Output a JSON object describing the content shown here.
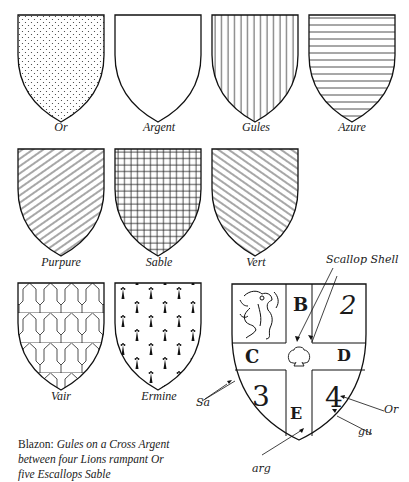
{
  "tinctures": [
    {
      "name": "Or",
      "pattern": "dots"
    },
    {
      "name": "Argent",
      "pattern": "plain"
    },
    {
      "name": "Gules",
      "pattern": "vertical-lines"
    },
    {
      "name": "Azure",
      "pattern": "horizontal-lines"
    },
    {
      "name": "Purpure",
      "pattern": "diagonal-sinister"
    },
    {
      "name": "Sable",
      "pattern": "grid"
    },
    {
      "name": "Vert",
      "pattern": "diagonal-dexter"
    },
    {
      "name": "Vair",
      "pattern": "vair"
    },
    {
      "name": "Ermine",
      "pattern": "ermine-spots"
    }
  ],
  "arms": {
    "cells": {
      "B": "B",
      "C": "C",
      "D": "D",
      "E": "E",
      "q2": "2",
      "q3": "3",
      "q4": "4"
    },
    "annotations": {
      "scallop": "Scallop Shell",
      "sa": "Sa",
      "or": "Or",
      "gu": "gu",
      "arg": "arg"
    }
  },
  "blazon": {
    "prefix": "Blazon:",
    "line1": "Gules on a Cross Argent",
    "line2": "between four Lions rampant Or",
    "line3": "five Escallops Sable"
  }
}
